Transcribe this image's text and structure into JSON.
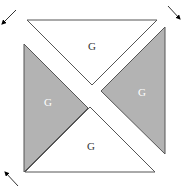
{
  "diagram": {
    "pieces": [
      {
        "id": "top",
        "label": "G",
        "fill": "#ffffff",
        "stroke": "#555555",
        "points": "27,20 157,20 92,85",
        "label_x": 92,
        "label_y": 47,
        "label_color": "#333333"
      },
      {
        "id": "right",
        "label": "G",
        "fill": "#b3b3b3",
        "stroke": "#555555",
        "points": "165,27 165,154 101,91",
        "label_x": 142,
        "label_y": 93,
        "label_color": "#ffffff"
      },
      {
        "id": "bottom",
        "label": "G",
        "fill": "#ffffff",
        "stroke": "#555555",
        "points": "25,172 155,172 90,107",
        "label_x": 91,
        "label_y": 147,
        "label_color": "#333333"
      },
      {
        "id": "left",
        "label": "G",
        "fill": "#b3b3b3",
        "stroke": "#555555",
        "points": "24,44 24,172 88,108",
        "label_x": 48,
        "label_y": 103,
        "label_color": "#ffffff"
      }
    ],
    "arrows": [
      {
        "id": "top-left",
        "direction": "down-left",
        "x1": 16,
        "y1": 10,
        "x2": 2,
        "y2": 24
      },
      {
        "id": "top-right",
        "direction": "down-right",
        "x1": 168,
        "y1": 6,
        "x2": 180,
        "y2": 19
      },
      {
        "id": "bottom-left",
        "direction": "up-left",
        "x1": 18,
        "y1": 186,
        "x2": 5,
        "y2": 172
      }
    ]
  }
}
